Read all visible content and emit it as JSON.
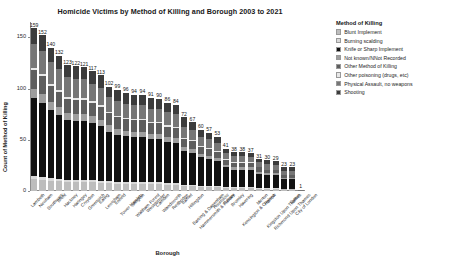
{
  "chart_data": {
    "type": "bar",
    "title": "Homicide Victims by Method of Killing and Borough 2003 to 2021",
    "xlabel": "Borough",
    "ylabel": "Count of Method of Killing",
    "ylim": [
      0,
      165
    ],
    "yticks": [
      0,
      50,
      100,
      150
    ],
    "grid": false,
    "stacked": true,
    "legend_position": "right",
    "legend_title": "Method of Killing",
    "categories": [
      "Lambeth",
      "Newham",
      "Southwark",
      "Brent",
      "Hackney",
      "Haringey",
      "Croydon",
      "Greenwich",
      "Ealing",
      "Lewisham",
      "Enfield",
      "Tower Hamlets",
      "Islington",
      "Waltham Forest",
      "Westminster",
      "Camden",
      "Wandsworth",
      "Redbridge",
      "Barnet",
      "Hillingdon",
      "Barking & Dagenham",
      "Hammersmith & Fulham",
      "Hounslow",
      "Bexley",
      "Bromley",
      "Havering",
      "Kensington & Chelsea",
      "Merton",
      "Harrow",
      "Kingston Upon Thames",
      "Richmond Upon Thames",
      "Sutton",
      "City of London"
    ],
    "values": [
      159,
      152,
      140,
      132,
      123,
      122,
      121,
      117,
      113,
      102,
      99,
      96,
      94,
      94,
      91,
      90,
      86,
      84,
      72,
      67,
      60,
      57,
      53,
      41,
      38,
      38,
      37,
      31,
      30,
      29,
      23,
      23,
      1
    ],
    "series": [
      {
        "name": "Blunt Implement",
        "color": "#bdbdbd",
        "values": [
          12,
          11,
          10,
          10,
          9,
          9,
          9,
          9,
          8,
          8,
          7,
          7,
          7,
          7,
          7,
          7,
          6,
          6,
          5,
          5,
          4,
          4,
          4,
          3,
          3,
          3,
          3,
          2,
          2,
          2,
          2,
          2,
          0
        ]
      },
      {
        "name": "Burning scalding",
        "color": "#d9d9d9",
        "values": [
          3,
          3,
          3,
          2,
          2,
          2,
          2,
          2,
          2,
          2,
          2,
          2,
          2,
          2,
          2,
          2,
          2,
          2,
          1,
          1,
          1,
          1,
          1,
          1,
          1,
          1,
          1,
          1,
          1,
          1,
          0,
          0,
          0
        ]
      },
      {
        "name": "Knife or Sharp Implement",
        "color": "#111111",
        "values": [
          76,
          72,
          66,
          62,
          58,
          57,
          57,
          55,
          53,
          48,
          46,
          45,
          44,
          44,
          42,
          42,
          40,
          39,
          33,
          31,
          28,
          26,
          24,
          19,
          17,
          17,
          17,
          14,
          13,
          13,
          10,
          10,
          0
        ]
      },
      {
        "name": "Not known/NNot Recorded",
        "color": "#9e9e9e",
        "values": [
          9,
          9,
          8,
          8,
          7,
          7,
          7,
          7,
          6,
          6,
          6,
          5,
          5,
          5,
          5,
          5,
          5,
          5,
          4,
          4,
          3,
          3,
          3,
          2,
          2,
          2,
          2,
          2,
          2,
          2,
          1,
          1,
          0
        ]
      },
      {
        "name": "Other Method of Killing",
        "color": "#5e5e5e",
        "values": [
          18,
          17,
          16,
          15,
          14,
          14,
          14,
          13,
          13,
          12,
          11,
          11,
          11,
          11,
          10,
          10,
          10,
          10,
          8,
          8,
          7,
          7,
          6,
          5,
          4,
          4,
          4,
          4,
          3,
          3,
          3,
          3,
          0
        ]
      },
      {
        "name": "Other poisoning (drugs, etc)",
        "color": "#e8e8e8",
        "values": [
          2,
          2,
          2,
          2,
          2,
          2,
          2,
          2,
          2,
          1,
          1,
          1,
          1,
          1,
          1,
          1,
          1,
          1,
          1,
          1,
          1,
          1,
          1,
          1,
          1,
          1,
          1,
          0,
          0,
          0,
          0,
          0,
          0
        ]
      },
      {
        "name": "Physical Assault, no weapons",
        "color": "#767676",
        "values": [
          24,
          23,
          21,
          20,
          19,
          18,
          18,
          17,
          17,
          15,
          15,
          14,
          14,
          14,
          13,
          13,
          13,
          12,
          11,
          10,
          9,
          9,
          8,
          6,
          6,
          6,
          5,
          5,
          5,
          4,
          4,
          4,
          1
        ]
      },
      {
        "name": "Shooting",
        "color": "#3c3c3c",
        "values": [
          15,
          15,
          14,
          13,
          12,
          13,
          12,
          12,
          12,
          10,
          11,
          11,
          10,
          10,
          11,
          10,
          9,
          9,
          9,
          7,
          7,
          6,
          6,
          4,
          4,
          4,
          4,
          3,
          4,
          4,
          3,
          3,
          0
        ]
      }
    ]
  }
}
